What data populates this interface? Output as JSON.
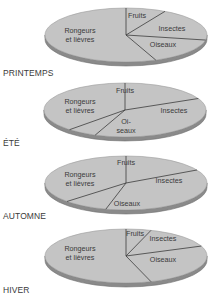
{
  "colors": {
    "face": "#c4c4c4",
    "side": "#8a8a8a",
    "side_dark": "#6e6e6e",
    "line": "#3c3c3c",
    "text": "#3a3a3a"
  },
  "chart_data": [
    {
      "type": "pie",
      "title": "PRINTEMPS",
      "categories": [
        "Fruits",
        "Insectes",
        "Oiseaux",
        "Rongeurs et lièvres"
      ],
      "values": [
        8,
        20,
        16,
        56
      ],
      "units": "% of diet (estimated from slice angles)"
    },
    {
      "type": "pie",
      "title": "ÉTÉ",
      "categories": [
        "Fruits",
        "Insectes",
        "Oiseaux",
        "Rongeurs et lièvres"
      ],
      "values": [
        18,
        38,
        6,
        38
      ],
      "units": "% of diet (estimated from slice angles)"
    },
    {
      "type": "pie",
      "title": "AUTOMNE",
      "categories": [
        "Fruits",
        "Insectes",
        "Oiseaux",
        "Rongeurs et lièvres"
      ],
      "values": [
        17,
        37,
        9,
        37
      ],
      "units": "% of diet (estimated from slice angles)"
    },
    {
      "type": "pie",
      "title": "HIVER",
      "categories": [
        "Fruits",
        "Insectes",
        "Oiseaux",
        "Rongeurs et lièvres"
      ],
      "values": [
        5,
        14,
        26,
        55
      ],
      "units": "% of diet (estimated from slice angles)"
    }
  ],
  "pies": [
    {
      "season": "PRINTEMPS",
      "cx": 126,
      "cy": 35,
      "label_y": 68,
      "slice_labels": [
        {
          "lines": [
            "Fruits"
          ],
          "x": 137,
          "y": 18
        },
        {
          "lines": [
            "Insectes"
          ],
          "x": 172,
          "y": 31
        },
        {
          "lines": [
            "Oiseaux"
          ],
          "x": 163,
          "y": 47
        },
        {
          "lines": [
            "Rongeurs",
            "et lièvres"
          ],
          "x": 80,
          "y": 33
        }
      ]
    },
    {
      "season": "ÉTÉ",
      "cx": 125,
      "cy": 110,
      "label_y": 138,
      "slice_labels": [
        {
          "lines": [
            "Fruits"
          ],
          "x": 125,
          "y": 93
        },
        {
          "lines": [
            "Insectes"
          ],
          "x": 174,
          "y": 113
        },
        {
          "lines": [
            "Oi-",
            "seaux"
          ],
          "x": 126,
          "y": 124
        },
        {
          "lines": [
            "Rongeurs",
            "et lièvres"
          ],
          "x": 80,
          "y": 104
        }
      ]
    },
    {
      "season": "AUTOMNE",
      "cx": 126,
      "cy": 183,
      "label_y": 211,
      "slice_labels": [
        {
          "lines": [
            "Fruits"
          ],
          "x": 126,
          "y": 165
        },
        {
          "lines": [
            "Insectes"
          ],
          "x": 169,
          "y": 183
        },
        {
          "lines": [
            "Oiseaux"
          ],
          "x": 127,
          "y": 206
        },
        {
          "lines": [
            "Rongeurs",
            "et lièvres"
          ],
          "x": 80,
          "y": 177
        }
      ]
    },
    {
      "season": "HIVER",
      "cx": 126,
      "cy": 256,
      "label_y": 285,
      "slice_labels": [
        {
          "lines": [
            "Fruits"
          ],
          "x": 135,
          "y": 236
        },
        {
          "lines": [
            "Insectes"
          ],
          "x": 163,
          "y": 241
        },
        {
          "lines": [
            "Oiseaux"
          ],
          "x": 163,
          "y": 262
        },
        {
          "lines": [
            "Rongeurs",
            "et lièvres"
          ],
          "x": 80,
          "y": 251
        }
      ]
    }
  ],
  "geometry": {
    "rx": 81,
    "ry": 27,
    "depth": 4,
    "start_angle_deg": -90
  }
}
